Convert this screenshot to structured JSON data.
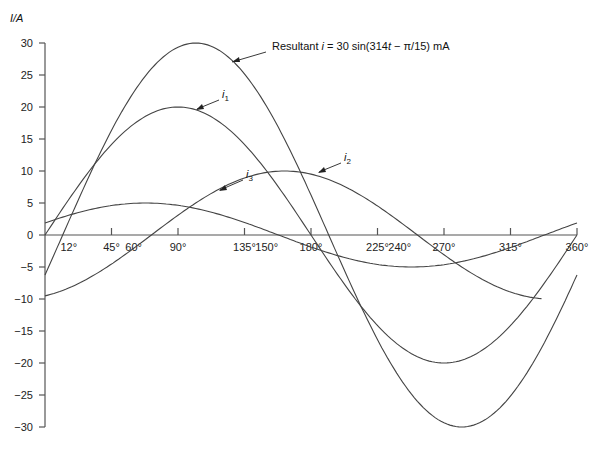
{
  "chart_data": {
    "type": "line",
    "title": "",
    "xlabel": "",
    "ylabel": "I/A",
    "xlim": [
      0,
      360
    ],
    "ylim": [
      -30,
      30
    ],
    "grid": false,
    "x_ticks": [
      {
        "value": 12,
        "label": "12°"
      },
      {
        "value": 45,
        "label": "45°"
      },
      {
        "value": 60,
        "label": "60°"
      },
      {
        "value": 90,
        "label": "90°"
      },
      {
        "value": 135,
        "label": "135°"
      },
      {
        "value": 150,
        "label": "150°"
      },
      {
        "value": 180,
        "label": "180°"
      },
      {
        "value": 225,
        "label": "225°"
      },
      {
        "value": 240,
        "label": "240°"
      },
      {
        "value": 270,
        "label": "270°"
      },
      {
        "value": 315,
        "label": "315°"
      },
      {
        "value": 360,
        "label": "360°"
      }
    ],
    "y_ticks": [
      30,
      25,
      20,
      15,
      10,
      5,
      0,
      -5,
      -10,
      -15,
      -20,
      -25,
      -30
    ],
    "series": [
      {
        "name": "Resultant",
        "label": "Resultant i = 30 sin(314t − π/15) mA",
        "amplitude": 30,
        "phase_deg": -12,
        "x_end": 360,
        "x": [
          0,
          12,
          45,
          90,
          102,
          135,
          180,
          192,
          225,
          270,
          282,
          315,
          360
        ],
        "values": [
          -6.2,
          0,
          16.3,
          29.3,
          30,
          25.2,
          6.2,
          0,
          -16.3,
          -29.3,
          -30,
          -25.2,
          -6.2
        ]
      },
      {
        "name": "i1",
        "label": "i1",
        "amplitude": 20,
        "phase_deg": 0,
        "x_end": 360,
        "x": [
          0,
          45,
          90,
          135,
          180,
          225,
          270,
          315,
          360
        ],
        "values": [
          0,
          14.1,
          20,
          14.1,
          0,
          -14.1,
          -20,
          -14.1,
          0
        ]
      },
      {
        "name": "i2",
        "label": "i2",
        "amplitude": 10,
        "phase_deg": -72,
        "x_end": 337,
        "x": [
          0,
          45,
          90,
          135,
          162,
          180,
          225,
          270,
          315,
          337
        ],
        "values": [
          -9.5,
          -4.5,
          3.1,
          8.1,
          10,
          9.5,
          4.5,
          -3.1,
          -8.1,
          -10
        ]
      },
      {
        "name": "i3",
        "label": "i3",
        "amplitude": 5,
        "phase_deg": 22,
        "x_end": 360,
        "x": [
          0,
          45,
          68,
          90,
          135,
          158,
          180,
          225,
          248,
          270,
          315,
          338,
          360
        ],
        "values": [
          1.9,
          4.6,
          5,
          4.6,
          1.9,
          0,
          -1.9,
          -4.6,
          -5,
          -4.6,
          -1.9,
          0,
          1.9
        ]
      }
    ],
    "annotations": [
      {
        "text": "Resultant i = 30 sin(314t − π/15) mA",
        "target": "Resultant"
      },
      {
        "text": "i1",
        "target": "i1"
      },
      {
        "text": "i2",
        "target": "i2"
      },
      {
        "text": "i3",
        "target": "i3"
      }
    ]
  },
  "axis": {
    "y_label": "I/A"
  },
  "annotations": {
    "resultant_prefix": "Resultant ",
    "resultant_i": "i",
    "resultant_eq": " = 30 sin(314",
    "resultant_t": "t",
    "resultant_tail": " − π/15) mA",
    "i1": "i",
    "i1_sub": "1",
    "i2": "i",
    "i2_sub": "2",
    "i3": "i",
    "i3_sub": "3"
  }
}
